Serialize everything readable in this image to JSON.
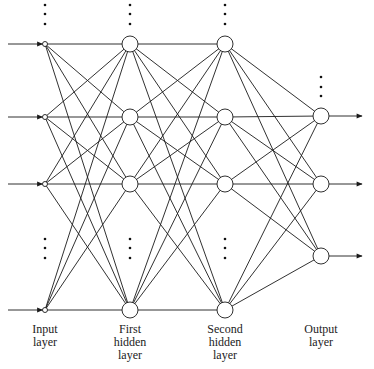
{
  "diagram": {
    "type": "feedforward-neural-network",
    "layers": [
      {
        "name": "input",
        "label_lines": [
          "Input",
          "layer"
        ],
        "x": 45,
        "node_radius": 2.5,
        "nodes_y": [
          44,
          117,
          184,
          310
        ],
        "ellipsis_top_y": [
          5,
          14,
          24
        ],
        "ellipsis_mid_y": [
          239,
          248,
          258
        ],
        "input_arrows": true
      },
      {
        "name": "first-hidden",
        "label_lines": [
          "First",
          "hidden",
          "layer"
        ],
        "x": 130,
        "node_radius": 8,
        "nodes_y": [
          44,
          117,
          184,
          310
        ],
        "ellipsis_top_y": [
          5,
          14,
          24
        ],
        "ellipsis_mid_y": [
          239,
          248,
          258
        ]
      },
      {
        "name": "second-hidden",
        "label_lines": [
          "Second",
          "hidden",
          "layer"
        ],
        "x": 225,
        "node_radius": 8,
        "nodes_y": [
          44,
          117,
          184,
          310
        ],
        "ellipsis_top_y": [
          5,
          14,
          24
        ],
        "ellipsis_mid_y": [
          239,
          248,
          258
        ]
      },
      {
        "name": "output",
        "label_lines": [
          "Output",
          "layer"
        ],
        "x": 321,
        "node_radius": 8,
        "nodes_y": [
          116,
          184,
          256
        ],
        "ellipsis_top_y": [
          77,
          87,
          96
        ],
        "output_arrows": true
      }
    ],
    "connectivity": "fully-connected",
    "input_arrow_start_x": 8,
    "output_arrow_end_x": 362,
    "label_y": [
      329,
      342,
      355
    ],
    "colors": {
      "stroke": "#1a1a1a",
      "background": "#ffffff",
      "text": "#222222"
    }
  }
}
